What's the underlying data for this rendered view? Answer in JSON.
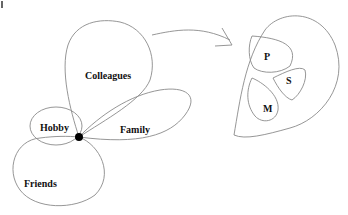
{
  "diagram": {
    "left": {
      "center_node": "ego-node",
      "circles": [
        {
          "label": "Colleagues"
        },
        {
          "label": "Family"
        },
        {
          "label": "Hobby"
        },
        {
          "label": "Friends"
        }
      ]
    },
    "right": {
      "groups": [
        {
          "label": "P"
        },
        {
          "label": "S"
        },
        {
          "label": "M"
        }
      ]
    }
  }
}
